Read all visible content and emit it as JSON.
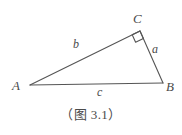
{
  "figure": {
    "caption": "（图 3.1）",
    "line_color": "#555555",
    "text_color": "#4a4a4a",
    "background_color": "#ffffff",
    "width": 182,
    "height": 135
  },
  "diagram_data": {
    "type": "geometry-diagram",
    "shape": "right-triangle",
    "right_angle_at": "C",
    "vertices": [
      {
        "name": "A",
        "label": "A",
        "x": 30,
        "y": 85
      },
      {
        "name": "B",
        "label": "B",
        "x": 163,
        "y": 83
      },
      {
        "name": "C",
        "label": "C",
        "x": 140,
        "y": 31
      }
    ],
    "sides": [
      {
        "name": "a",
        "label": "a",
        "from": "C",
        "to": "B",
        "label_x": 157,
        "label_y": 49
      },
      {
        "name": "b",
        "label": "b",
        "from": "A",
        "to": "C",
        "label_x": 78,
        "label_y": 45
      },
      {
        "name": "c",
        "label": "c",
        "from": "A",
        "to": "B",
        "label_x": 101,
        "label_y": 92
      }
    ],
    "right_angle_marker": {
      "at": "C",
      "size": 8
    }
  }
}
